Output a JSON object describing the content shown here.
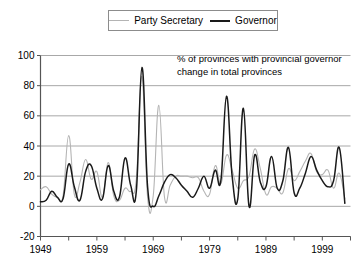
{
  "legend": {
    "position": "top-center",
    "entries": [
      {
        "label": "Party Secretary",
        "color": "#b4b4b4",
        "icon": "line-swatch-icon"
      },
      {
        "label": "Governor",
        "color": "#1a1a1a",
        "icon": "line-swatch-icon"
      }
    ]
  },
  "annotation": {
    "line1": "% of provinces with provincial governor",
    "line2": "change in total provinces"
  },
  "chart_data": {
    "type": "line",
    "title": "",
    "subtitle": "",
    "annotation": "% of provinces with provincial governor change in total provinces",
    "xlabel": "",
    "ylabel": "",
    "xlim": [
      1949,
      2004
    ],
    "ylim": [
      -20,
      100
    ],
    "yticks": [
      -20,
      0,
      20,
      40,
      60,
      80,
      100
    ],
    "ytick_labels": [
      "-20",
      "0",
      "20",
      "40",
      "60",
      "80",
      "100"
    ],
    "xticks": [
      1949,
      1959,
      1969,
      1979,
      1989,
      1999
    ],
    "xtick_labels": [
      "1949",
      "1959",
      "1969",
      "1979",
      "1989",
      "1999"
    ],
    "xminor_ticks": [
      1954,
      1964,
      1974,
      1984,
      1994,
      2004
    ],
    "grid": "horizontal",
    "legend_position": "top-center",
    "x": [
      1949,
      1950,
      1951,
      1952,
      1953,
      1954,
      1955,
      1956,
      1957,
      1958,
      1959,
      1960,
      1961,
      1962,
      1963,
      1964,
      1965,
      1966,
      1967,
      1968,
      1969,
      1970,
      1971,
      1972,
      1973,
      1974,
      1975,
      1976,
      1977,
      1978,
      1979,
      1980,
      1981,
      1982,
      1983,
      1984,
      1985,
      1986,
      1987,
      1988,
      1989,
      1990,
      1991,
      1992,
      1993,
      1994,
      1995,
      1996,
      1997,
      1998,
      1999,
      2000,
      2001,
      2002,
      2003
    ],
    "series": [
      {
        "name": "Governor",
        "color": "#1a1a1a",
        "values": [
          3,
          4,
          10,
          6,
          5,
          28,
          13,
          4,
          23,
          27,
          12,
          5,
          27,
          10,
          6,
          32,
          14,
          10,
          92,
          13,
          0,
          7,
          16,
          21,
          19,
          14,
          10,
          6,
          12,
          20,
          12,
          24,
          17,
          73,
          20,
          5,
          65,
          0,
          34,
          16,
          13,
          33,
          12,
          17,
          39,
          9,
          12,
          22,
          33,
          24,
          17,
          13,
          17,
          39,
          2
        ]
      },
      {
        "name": "Party Secretary",
        "color": "#b4b4b4",
        "values": [
          11,
          13,
          8,
          6,
          7,
          47,
          8,
          16,
          31,
          18,
          23,
          6,
          29,
          7,
          4,
          12,
          10,
          18,
          86,
          6,
          7,
          67,
          6,
          14,
          20,
          20,
          20,
          19,
          19,
          10,
          8,
          27,
          15,
          34,
          24,
          12,
          17,
          20,
          38,
          25,
          8,
          13,
          12,
          9,
          25,
          17,
          23,
          30,
          35,
          23,
          21,
          24,
          12,
          22,
          5
        ]
      }
    ]
  }
}
